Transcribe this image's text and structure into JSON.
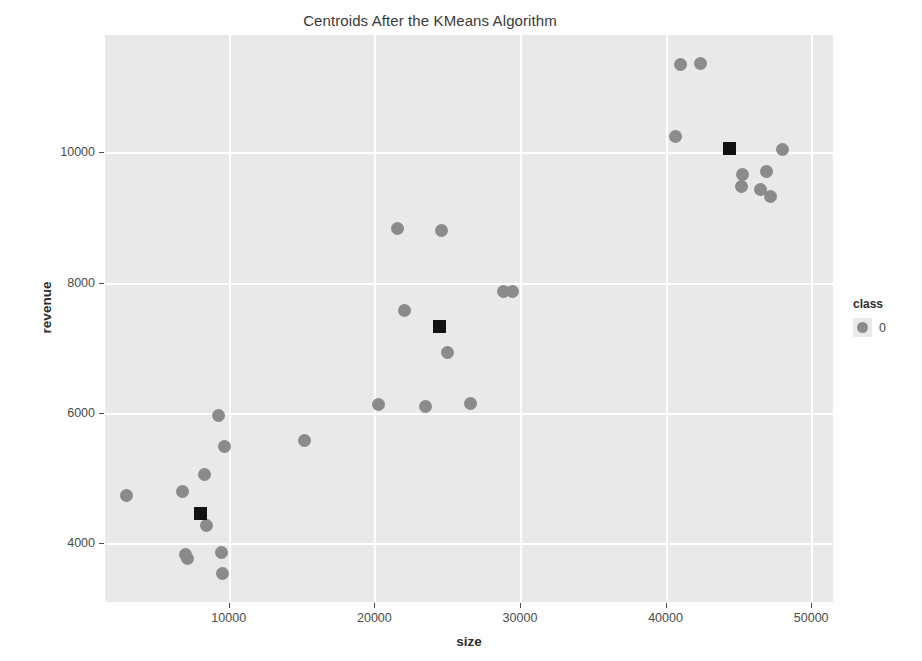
{
  "chart_data": {
    "type": "scatter",
    "title": "Centroids After the KMeans Algorithm",
    "xlabel": "size",
    "ylabel": "revenue",
    "xlim": [
      1500,
      51500
    ],
    "ylim": [
      3100,
      11800
    ],
    "xticks": [
      10000,
      20000,
      30000,
      40000,
      50000
    ],
    "xtick_labels": [
      "10000",
      "20000",
      "30000",
      "40000",
      "50000"
    ],
    "yticks": [
      4000,
      6000,
      8000,
      10000
    ],
    "ytick_labels": [
      "4000",
      "6000",
      "8000",
      "10000"
    ],
    "grid": true,
    "grid_color": "#ffffff",
    "panel_color": "#e9e9e9",
    "legend": {
      "title": "class",
      "position": "right",
      "entries": [
        {
          "label": "0",
          "marker": "circle",
          "color": "#8b8b8b"
        }
      ]
    },
    "series": [
      {
        "name": "0",
        "marker": "circle",
        "color": "#8b8b8b",
        "points": [
          {
            "x": 41000,
            "y": 11350
          },
          {
            "x": 42400,
            "y": 11360
          },
          {
            "x": 40700,
            "y": 10250
          },
          {
            "x": 48000,
            "y": 10050
          },
          {
            "x": 45300,
            "y": 9660
          },
          {
            "x": 45200,
            "y": 9470
          },
          {
            "x": 46900,
            "y": 9700
          },
          {
            "x": 46500,
            "y": 9430
          },
          {
            "x": 47200,
            "y": 9320
          },
          {
            "x": 21600,
            "y": 8830
          },
          {
            "x": 24600,
            "y": 8800
          },
          {
            "x": 28900,
            "y": 7870
          },
          {
            "x": 29500,
            "y": 7860
          },
          {
            "x": 22100,
            "y": 7580
          },
          {
            "x": 25000,
            "y": 6930
          },
          {
            "x": 20300,
            "y": 6130
          },
          {
            "x": 23500,
            "y": 6100
          },
          {
            "x": 26600,
            "y": 6150
          },
          {
            "x": 9300,
            "y": 5960
          },
          {
            "x": 15200,
            "y": 5580
          },
          {
            "x": 9700,
            "y": 5480
          },
          {
            "x": 8300,
            "y": 5060
          },
          {
            "x": 3000,
            "y": 4730
          },
          {
            "x": 6800,
            "y": 4800
          },
          {
            "x": 8500,
            "y": 4280
          },
          {
            "x": 7000,
            "y": 3830
          },
          {
            "x": 7200,
            "y": 3770
          },
          {
            "x": 9500,
            "y": 3860
          },
          {
            "x": 9600,
            "y": 3530
          }
        ]
      },
      {
        "name": "centroids",
        "marker": "square",
        "color": "#111111",
        "points": [
          {
            "x": 44400,
            "y": 10060
          },
          {
            "x": 24500,
            "y": 7330
          },
          {
            "x": 8050,
            "y": 4460
          }
        ]
      }
    ]
  }
}
